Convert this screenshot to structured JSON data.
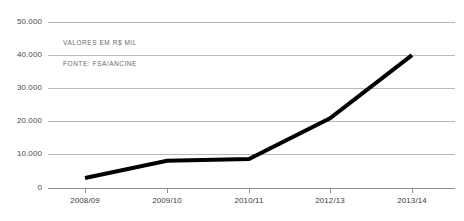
{
  "chart_data": {
    "type": "line",
    "title": "",
    "subtitle": "",
    "xlabel": "",
    "ylabel": "",
    "categories": [
      "2008/09",
      "2009/10",
      "2010/11",
      "2012/13",
      "2013/14"
    ],
    "series": [
      {
        "name": "Valores em R$ mil",
        "values": [
          3000,
          8200,
          8700,
          21000,
          40000
        ],
        "color": "#000000",
        "line_width": 4
      }
    ],
    "ylim": [
      0,
      50000
    ],
    "yticks": [
      0,
      10000,
      20000,
      30000,
      40000,
      50000
    ],
    "ytick_labels": [
      "0",
      "10.000",
      "20.000",
      "30.000",
      "40.000",
      "50.000"
    ],
    "grid": true,
    "grid_color": "#b9b9b9",
    "legend": "none",
    "annotations": [
      {
        "text": "VALORES EM R$ MIL"
      },
      {
        "text": "FONTE: FSA/ANCINE"
      }
    ]
  },
  "axes": {
    "y": {
      "ticks": [
        {
          "label": "50.000",
          "value": 50000
        },
        {
          "label": "40.000",
          "value": 40000
        },
        {
          "label": "30.000",
          "value": 30000
        },
        {
          "label": "20.000",
          "value": 20000
        },
        {
          "label": "10.000",
          "value": 10000
        },
        {
          "label": "0",
          "value": 0
        }
      ]
    },
    "x": {
      "ticks": [
        {
          "label": "2008/09"
        },
        {
          "label": "2009/10"
        },
        {
          "label": "2010/11"
        },
        {
          "label": "2012/13"
        },
        {
          "label": "2013/14"
        }
      ]
    }
  },
  "notes": {
    "units": "VALORES EM R$ MIL",
    "source": "FONTE: FSA/ANCINE"
  }
}
